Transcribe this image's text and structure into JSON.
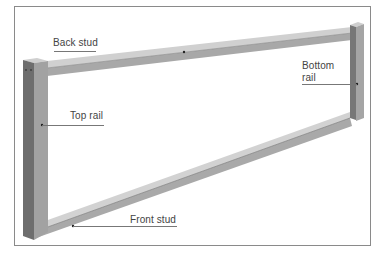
{
  "diagram": {
    "labels": {
      "back_stud": "Back stud",
      "top_rail": "Top rail",
      "bottom_rail_line1": "Bottom",
      "bottom_rail_line2": "rail",
      "front_stud": "Front stud"
    },
    "colors": {
      "wood_face": "#b4b4b4",
      "wood_dark": "#7a7a7a",
      "wood_top": "#d2d2d2",
      "border": "#8a8a8a",
      "text": "#444444"
    }
  }
}
